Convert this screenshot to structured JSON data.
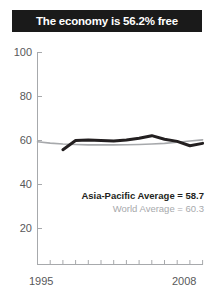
{
  "title": {
    "text": "The economy is 56.2% free",
    "background_color": "#1a1a1a",
    "text_color": "#ffffff"
  },
  "legend": {
    "asia_label": "Asia-Pacific Average = 58.7",
    "world_label": "World Average = 60.3",
    "asia_color": "#231f20",
    "world_color": "#a7a9ac"
  },
  "axis": {
    "y_ticks": [
      "100",
      "80",
      "60",
      "40",
      "20"
    ],
    "x_start": "1995",
    "x_end": "2008",
    "axis_color": "#a7a9ac",
    "tick_label_color": "#58585a"
  },
  "chart_data": {
    "type": "line",
    "title": "The economy is 56.2% free",
    "xlabel": "",
    "ylabel": "",
    "xlim": [
      1995,
      2008
    ],
    "ylim": [
      0,
      100
    ],
    "ytick_values": [
      20,
      40,
      60,
      80,
      100
    ],
    "xtick_values": [
      1995,
      1996,
      1997,
      1998,
      1999,
      2000,
      2001,
      2002,
      2003,
      2004,
      2005,
      2006,
      2007,
      2008
    ],
    "xtick_labels_shown": [
      "1995",
      "2008"
    ],
    "grid": false,
    "legend_position": "inside-right",
    "annotations": [
      {
        "text": "Asia-Pacific Average = 58.7",
        "value": 58.7
      },
      {
        "text": "World Average = 60.3",
        "value": 60.3
      }
    ],
    "series": [
      {
        "name": "Asia-Pacific Average",
        "color": "#231f20",
        "line_width": 3,
        "x": [
          1997,
          1998,
          1999,
          2000,
          2001,
          2002,
          2003,
          2004,
          2005,
          2006,
          2007,
          2008
        ],
        "values": [
          55.8,
          60.0,
          60.2,
          60.0,
          59.8,
          60.2,
          61.0,
          62.2,
          60.6,
          59.6,
          57.6,
          58.7
        ]
      },
      {
        "name": "World Average",
        "color": "#a7a9ac",
        "line_width": 1.6,
        "x": [
          1995,
          1996,
          1997,
          1998,
          1999,
          2000,
          2001,
          2002,
          2003,
          2004,
          2005,
          2006,
          2007,
          2008
        ],
        "values": [
          59.4,
          58.8,
          58.4,
          58.2,
          58.0,
          58.0,
          58.0,
          58.1,
          58.2,
          58.4,
          58.7,
          59.2,
          59.8,
          60.3
        ]
      }
    ]
  }
}
